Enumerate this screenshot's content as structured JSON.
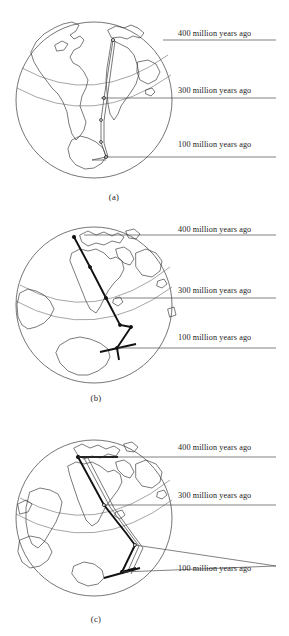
{
  "figure": {
    "type": "apparent-polar-wander-globe-diagram",
    "panel_count": 3,
    "stroke_color": "#111111",
    "outline_color": "#3a3a3a",
    "graticule_color": "#6a6a6a"
  },
  "panels": [
    {
      "id": "a",
      "caption": "(a)",
      "globe": {
        "cx": 94,
        "cy": 100,
        "r": 78
      },
      "annotations": [
        {
          "key": "ma400",
          "label": "400 million years ago",
          "text_x": 178,
          "text_y": 36,
          "leader": "M 163 40 L 276 40"
        },
        {
          "key": "ma300",
          "label": "300 million years ago",
          "text_x": 178,
          "text_y": 93,
          "leader": "M 101 98 L 276 98"
        },
        {
          "key": "ma100",
          "label": "100 million years ago",
          "text_x": 178,
          "text_y": 147,
          "leader": "M 104 157 L 276 157"
        }
      ],
      "apw": {
        "description": "narrow near-vertical double track from 400 Ma in north to 100 Ma near south pole",
        "nodes": [
          {
            "x": 113,
            "y": 40,
            "type": "open"
          },
          {
            "x": 104,
            "y": 98,
            "type": "open"
          },
          {
            "x": 101,
            "y": 120,
            "type": "open"
          },
          {
            "x": 101,
            "y": 142,
            "type": "open"
          },
          {
            "x": 106,
            "y": 157,
            "type": "open"
          },
          {
            "x": 92,
            "y": 160,
            "type": "open"
          }
        ]
      }
    },
    {
      "id": "b",
      "caption": "(b)",
      "globe": {
        "cx": 94,
        "cy": 100,
        "r": 78
      },
      "annotations": [
        {
          "key": "ma400",
          "label": "400 million years ago",
          "text_x": 178,
          "text_y": 27,
          "leader": "M 84 30 L 276 30"
        },
        {
          "key": "ma300",
          "label": "300 million years ago",
          "text_x": 178,
          "text_y": 88,
          "leader": "M 115 93 L 276 93"
        },
        {
          "key": "ma100",
          "label": "100 million years ago",
          "text_x": 178,
          "text_y": 135,
          "leader": "M 118 143 L 276 143"
        }
      ],
      "apw": {
        "description": "bold zigzag track running NNW to SSE with kinks near 100 Ma",
        "nodes": [
          {
            "x": 74,
            "y": 32,
            "type": "solid"
          },
          {
            "x": 90,
            "y": 62,
            "type": "solid"
          },
          {
            "x": 106,
            "y": 93,
            "type": "solid"
          },
          {
            "x": 120,
            "y": 120,
            "type": "solid"
          },
          {
            "x": 131,
            "y": 122,
            "type": "solid"
          },
          {
            "x": 117,
            "y": 143,
            "type": "solid"
          },
          {
            "x": 119,
            "y": 155,
            "type": "solid"
          }
        ]
      }
    },
    {
      "id": "c",
      "caption": "(c)",
      "globe": {
        "cx": 94,
        "cy": 100,
        "r": 78
      },
      "annotations": [
        {
          "key": "ma400",
          "label": "400 million years ago",
          "text_x": 178,
          "text_y": 50,
          "leader": "M 78 57 L 276 57"
        },
        {
          "key": "ma300",
          "label": "300 million years ago",
          "text_x": 178,
          "text_y": 98,
          "leader": "M 104 105 L 276 105"
        },
        {
          "key": "ma100",
          "label": "100 million years ago",
          "text_x": 178,
          "text_y": 171,
          "leader": "M 135 145 L 276 166 M 122 172 L 276 166"
        }
      ],
      "apw": {
        "description": "two converging tracks from a common 400 Ma origin, crossing near 100 Ma",
        "nodes": [
          {
            "x": 78,
            "y": 57,
            "type": "solid"
          },
          {
            "x": 118,
            "y": 57,
            "type": "solid"
          },
          {
            "x": 135,
            "y": 145,
            "type": "open"
          },
          {
            "x": 122,
            "y": 172,
            "type": "solid"
          },
          {
            "x": 136,
            "y": 168,
            "type": "solid"
          }
        ]
      }
    }
  ]
}
